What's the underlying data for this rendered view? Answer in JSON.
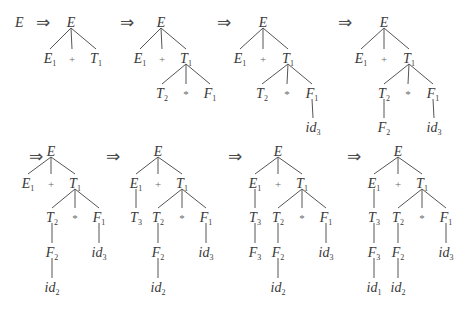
{
  "start_symbol": "E",
  "derive_symbol": "⇒",
  "trees": [
    {
      "id": "t1",
      "nodes": [
        {
          "id": "E",
          "s": "E",
          "sub": "",
          "x": 71,
          "y": 22
        },
        {
          "id": "E1",
          "s": "E",
          "sub": "1",
          "x": 50,
          "y": 58,
          "p": "E"
        },
        {
          "id": "plus",
          "s": "+",
          "sub": "",
          "x": 72,
          "y": 58,
          "p": "E",
          "op": true
        },
        {
          "id": "T1",
          "s": "T",
          "sub": "1",
          "x": 96,
          "y": 58,
          "p": "E"
        }
      ]
    },
    {
      "id": "t2",
      "nodes": [
        {
          "id": "E",
          "s": "E",
          "sub": "",
          "x": 161,
          "y": 22
        },
        {
          "id": "E1",
          "s": "E",
          "sub": "1",
          "x": 140,
          "y": 58,
          "p": "E"
        },
        {
          "id": "plus",
          "s": "+",
          "sub": "",
          "x": 162,
          "y": 58,
          "p": "E",
          "op": true
        },
        {
          "id": "T1",
          "s": "T",
          "sub": "1",
          "x": 186,
          "y": 58,
          "p": "E"
        },
        {
          "id": "T2",
          "s": "T",
          "sub": "2",
          "x": 162,
          "y": 93,
          "p": "T1"
        },
        {
          "id": "star",
          "s": "*",
          "sub": "",
          "x": 186,
          "y": 93,
          "p": "T1",
          "op": true
        },
        {
          "id": "F1",
          "s": "F",
          "sub": "1",
          "x": 210,
          "y": 93,
          "p": "T1"
        }
      ]
    },
    {
      "id": "t3",
      "nodes": [
        {
          "id": "E",
          "s": "E",
          "sub": "",
          "x": 263,
          "y": 22
        },
        {
          "id": "E1",
          "s": "E",
          "sub": "1",
          "x": 240,
          "y": 58,
          "p": "E"
        },
        {
          "id": "plus",
          "s": "+",
          "sub": "",
          "x": 263,
          "y": 58,
          "p": "E",
          "op": true
        },
        {
          "id": "T1",
          "s": "T",
          "sub": "1",
          "x": 288,
          "y": 58,
          "p": "E"
        },
        {
          "id": "T2",
          "s": "T",
          "sub": "2",
          "x": 262,
          "y": 93,
          "p": "T1"
        },
        {
          "id": "star",
          "s": "*",
          "sub": "",
          "x": 287,
          "y": 93,
          "p": "T1",
          "op": true
        },
        {
          "id": "F1",
          "s": "F",
          "sub": "1",
          "x": 312,
          "y": 93,
          "p": "T1"
        },
        {
          "id": "id3",
          "s": "id",
          "sub": "3",
          "x": 313,
          "y": 127,
          "p": "F1"
        }
      ]
    },
    {
      "id": "t4",
      "nodes": [
        {
          "id": "E",
          "s": "E",
          "sub": "",
          "x": 384,
          "y": 22
        },
        {
          "id": "E1",
          "s": "E",
          "sub": "1",
          "x": 361,
          "y": 58,
          "p": "E"
        },
        {
          "id": "plus",
          "s": "+",
          "sub": "",
          "x": 384,
          "y": 58,
          "p": "E",
          "op": true
        },
        {
          "id": "T1",
          "s": "T",
          "sub": "1",
          "x": 409,
          "y": 58,
          "p": "E"
        },
        {
          "id": "T2",
          "s": "T",
          "sub": "2",
          "x": 384,
          "y": 93,
          "p": "T1"
        },
        {
          "id": "star",
          "s": "*",
          "sub": "",
          "x": 408,
          "y": 93,
          "p": "T1",
          "op": true
        },
        {
          "id": "F1",
          "s": "F",
          "sub": "1",
          "x": 433,
          "y": 93,
          "p": "T1"
        },
        {
          "id": "F2",
          "s": "F",
          "sub": "2",
          "x": 384,
          "y": 127,
          "p": "T2"
        },
        {
          "id": "id3",
          "s": "id",
          "sub": "3",
          "x": 434,
          "y": 127,
          "p": "F1"
        }
      ]
    },
    {
      "id": "t5",
      "nodes": [
        {
          "id": "E",
          "s": "E",
          "sub": "",
          "x": 51,
          "y": 151
        },
        {
          "id": "E1",
          "s": "E",
          "sub": "1",
          "x": 28,
          "y": 183,
          "p": "E"
        },
        {
          "id": "plus",
          "s": "+",
          "sub": "",
          "x": 51,
          "y": 183,
          "p": "E",
          "op": true
        },
        {
          "id": "T1",
          "s": "T",
          "sub": "1",
          "x": 75,
          "y": 183,
          "p": "E"
        },
        {
          "id": "T2",
          "s": "T",
          "sub": "2",
          "x": 52,
          "y": 217,
          "p": "T1"
        },
        {
          "id": "star",
          "s": "*",
          "sub": "",
          "x": 75,
          "y": 217,
          "p": "T1",
          "op": true
        },
        {
          "id": "F1",
          "s": "F",
          "sub": "1",
          "x": 99,
          "y": 217,
          "p": "T1"
        },
        {
          "id": "F2",
          "s": "F",
          "sub": "2",
          "x": 52,
          "y": 252,
          "p": "T2"
        },
        {
          "id": "id3",
          "s": "id",
          "sub": "3",
          "x": 99,
          "y": 252,
          "p": "F1"
        },
        {
          "id": "id2",
          "s": "id",
          "sub": "2",
          "x": 52,
          "y": 287,
          "p": "F2"
        }
      ]
    },
    {
      "id": "t6",
      "nodes": [
        {
          "id": "E",
          "s": "E",
          "sub": "",
          "x": 158,
          "y": 151
        },
        {
          "id": "E1",
          "s": "E",
          "sub": "1",
          "x": 136,
          "y": 183,
          "p": "E"
        },
        {
          "id": "plus",
          "s": "+",
          "sub": "",
          "x": 158,
          "y": 183,
          "p": "E",
          "op": true
        },
        {
          "id": "T1",
          "s": "T",
          "sub": "1",
          "x": 182,
          "y": 183,
          "p": "E"
        },
        {
          "id": "T3",
          "s": "T",
          "sub": "3",
          "x": 136,
          "y": 217,
          "p": "E1"
        },
        {
          "id": "T2",
          "s": "T",
          "sub": "2",
          "x": 158,
          "y": 217,
          "p": "T1"
        },
        {
          "id": "star",
          "s": "*",
          "sub": "",
          "x": 182,
          "y": 217,
          "p": "T1",
          "op": true
        },
        {
          "id": "F1",
          "s": "F",
          "sub": "1",
          "x": 206,
          "y": 217,
          "p": "T1"
        },
        {
          "id": "F2",
          "s": "F",
          "sub": "2",
          "x": 158,
          "y": 252,
          "p": "T2"
        },
        {
          "id": "id3",
          "s": "id",
          "sub": "3",
          "x": 206,
          "y": 252,
          "p": "F1"
        },
        {
          "id": "id2",
          "s": "id",
          "sub": "2",
          "x": 158,
          "y": 287,
          "p": "F2"
        }
      ]
    },
    {
      "id": "t7",
      "nodes": [
        {
          "id": "E",
          "s": "E",
          "sub": "",
          "x": 278,
          "y": 151
        },
        {
          "id": "E1",
          "s": "E",
          "sub": "1",
          "x": 255,
          "y": 183,
          "p": "E"
        },
        {
          "id": "plus",
          "s": "+",
          "sub": "",
          "x": 278,
          "y": 183,
          "p": "E",
          "op": true
        },
        {
          "id": "T1",
          "s": "T",
          "sub": "1",
          "x": 302,
          "y": 183,
          "p": "E"
        },
        {
          "id": "T3",
          "s": "T",
          "sub": "3",
          "x": 255,
          "y": 217,
          "p": "E1"
        },
        {
          "id": "T2",
          "s": "T",
          "sub": "2",
          "x": 278,
          "y": 217,
          "p": "T1"
        },
        {
          "id": "star",
          "s": "*",
          "sub": "",
          "x": 302,
          "y": 217,
          "p": "T1",
          "op": true
        },
        {
          "id": "F1",
          "s": "F",
          "sub": "1",
          "x": 326,
          "y": 217,
          "p": "T1"
        },
        {
          "id": "F3",
          "s": "F",
          "sub": "3",
          "x": 255,
          "y": 252,
          "p": "T3"
        },
        {
          "id": "F2",
          "s": "F",
          "sub": "2",
          "x": 278,
          "y": 252,
          "p": "T2"
        },
        {
          "id": "id3",
          "s": "id",
          "sub": "3",
          "x": 326,
          "y": 252,
          "p": "F1"
        },
        {
          "id": "id2",
          "s": "id",
          "sub": "2",
          "x": 278,
          "y": 287,
          "p": "F2"
        }
      ]
    },
    {
      "id": "t8",
      "nodes": [
        {
          "id": "E",
          "s": "E",
          "sub": "",
          "x": 398,
          "y": 151
        },
        {
          "id": "E1",
          "s": "E",
          "sub": "1",
          "x": 374,
          "y": 183,
          "p": "E"
        },
        {
          "id": "plus",
          "s": "+",
          "sub": "",
          "x": 398,
          "y": 183,
          "p": "E",
          "op": true
        },
        {
          "id": "T1",
          "s": "T",
          "sub": "1",
          "x": 422,
          "y": 183,
          "p": "E"
        },
        {
          "id": "T3",
          "s": "T",
          "sub": "3",
          "x": 374,
          "y": 217,
          "p": "E1"
        },
        {
          "id": "T2",
          "s": "T",
          "sub": "2",
          "x": 398,
          "y": 217,
          "p": "T1"
        },
        {
          "id": "star",
          "s": "*",
          "sub": "",
          "x": 422,
          "y": 217,
          "p": "T1",
          "op": true
        },
        {
          "id": "F1",
          "s": "F",
          "sub": "1",
          "x": 446,
          "y": 217,
          "p": "T1"
        },
        {
          "id": "F3",
          "s": "F",
          "sub": "3",
          "x": 374,
          "y": 252,
          "p": "T3"
        },
        {
          "id": "F2",
          "s": "F",
          "sub": "2",
          "x": 398,
          "y": 252,
          "p": "T2"
        },
        {
          "id": "id3",
          "s": "id",
          "sub": "3",
          "x": 446,
          "y": 252,
          "p": "F1"
        },
        {
          "id": "id1",
          "s": "id",
          "sub": "1",
          "x": 374,
          "y": 287,
          "p": "F3"
        },
        {
          "id": "id2",
          "s": "id",
          "sub": "2",
          "x": 398,
          "y": 287,
          "p": "F2"
        }
      ]
    }
  ],
  "arrows": [
    {
      "x": 29,
      "y": 22
    },
    {
      "x": 120,
      "y": 22
    },
    {
      "x": 217,
      "y": 22
    },
    {
      "x": 338,
      "y": 22
    },
    {
      "x": 29,
      "y": 156
    },
    {
      "x": 106,
      "y": 156
    },
    {
      "x": 228,
      "y": 156
    },
    {
      "x": 347,
      "y": 156
    }
  ]
}
